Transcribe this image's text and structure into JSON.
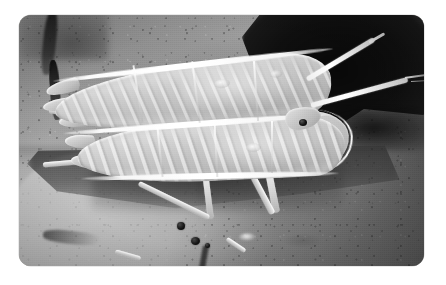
{
  "page": {
    "background_color": "#ffffff",
    "width": 446,
    "height": 285,
    "caption": ""
  },
  "photo": {
    "name": "insect-photograph",
    "alt_text": "Grayscale close-up photograph of a shield-shaped bug with broad pale wing covers resting on a rough stone surface",
    "frame": {
      "left": 19,
      "top": 15,
      "width": 405,
      "height": 251,
      "corner_radius": 12,
      "border_color": "#bdbdbd"
    },
    "rendering": {
      "color_mode": "grayscale",
      "mid_tone": "#8d8d8d",
      "highlight_tone": "#f4f2ec",
      "shadow_tone": "#3a3a3a",
      "darkest_tone": "#0a0a0a"
    },
    "subject": {
      "label": "bug",
      "parts": [
        {
          "name": "upper-forewing",
          "tone": "#c9c6bd"
        },
        {
          "name": "lower-forewing",
          "tone": "#cbc8bf"
        },
        {
          "name": "shoulder-fan",
          "tone": "#d9d6cd"
        },
        {
          "name": "head",
          "tone": "#e2dfd6"
        },
        {
          "name": "eye",
          "tone": "#131313"
        },
        {
          "name": "antenna-upper",
          "tone": "#ffffff"
        },
        {
          "name": "antenna-lower",
          "tone": "#ffffff"
        },
        {
          "name": "middle-leg",
          "tone": "#dcd9d1"
        },
        {
          "name": "hind-leg",
          "tone": "#dcd9d1"
        },
        {
          "name": "front-legs",
          "tone": "#efece4"
        },
        {
          "name": "tarsal-joints",
          "tone": "#161616"
        }
      ]
    },
    "scene": {
      "background_elements": [
        {
          "name": "stone-substrate",
          "tone": "#9b9a96"
        },
        {
          "name": "pale-stone-slab",
          "tone": "#cecbc4"
        },
        {
          "name": "dark-background-void",
          "tone": "#0d0d0d"
        },
        {
          "name": "vertical-crack",
          "tone": "#161616"
        },
        {
          "name": "cast-shadow",
          "tone": "#3a3a3a"
        },
        {
          "name": "specular-highlight",
          "tone": "#ffffff"
        }
      ]
    }
  }
}
